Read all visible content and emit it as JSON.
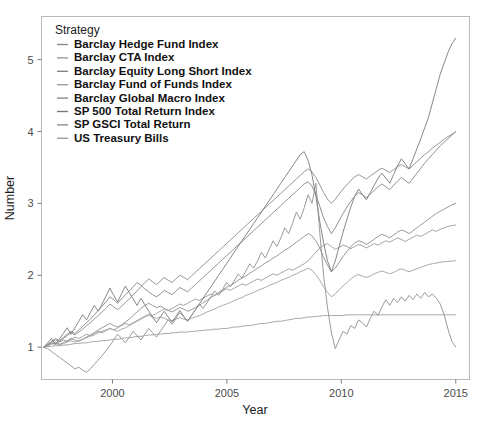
{
  "chart_data": {
    "type": "line",
    "title": "",
    "xlabel": "Year",
    "ylabel": "Number",
    "legend_title": "Strategy",
    "legend_position": "top-left-inside",
    "grid": false,
    "xlim": [
      1996.9,
      2015.6
    ],
    "ylim": [
      0.55,
      5.6
    ],
    "xticks": [
      2000,
      2005,
      2010,
      2015
    ],
    "xtick_labels": [
      "2000",
      "2005",
      "2010",
      "2015"
    ],
    "yticks": [
      1,
      2,
      3,
      4,
      5
    ],
    "ytick_labels": [
      "1",
      "2",
      "3",
      "4",
      "5"
    ],
    "x_start": 1997.0,
    "x_end": 2015.0,
    "note": "Cumulative growth of 1 unit invested; all series indexed to 1.0 at start (1997).",
    "series": [
      {
        "name": "Barclay Hedge Fund Index",
        "color": "#8d8d8d",
        "end_value": 3.0,
        "values": [
          1.0,
          1.02,
          1.05,
          1.07,
          1.04,
          1.06,
          1.09,
          1.12,
          1.1,
          1.08,
          1.11,
          1.14,
          1.17,
          1.2,
          1.24,
          1.27,
          1.3,
          1.33,
          1.3,
          1.28,
          1.31,
          1.35,
          1.39,
          1.44,
          1.49,
          1.54,
          1.58,
          1.61,
          1.58,
          1.55,
          1.57,
          1.54,
          1.51,
          1.49,
          1.52,
          1.55,
          1.53,
          1.5,
          1.52,
          1.55,
          1.58,
          1.62,
          1.65,
          1.69,
          1.72,
          1.76,
          1.8,
          1.83,
          1.86,
          1.89,
          1.93,
          1.96,
          1.99,
          2.03,
          2.06,
          2.1,
          2.13,
          2.17,
          2.2,
          2.24,
          2.27,
          2.31,
          2.35,
          2.38,
          2.42,
          2.46,
          2.5,
          2.54,
          2.58,
          2.55,
          2.48,
          2.38,
          2.25,
          2.14,
          2.05,
          2.1,
          2.18,
          2.26,
          2.33,
          2.4,
          2.45,
          2.48,
          2.46,
          2.43,
          2.46,
          2.5,
          2.54,
          2.57,
          2.55,
          2.52,
          2.56,
          2.6,
          2.63,
          2.61,
          2.58,
          2.62,
          2.66,
          2.7,
          2.74,
          2.78,
          2.82,
          2.86,
          2.89,
          2.92,
          2.95,
          2.98,
          3.0
        ]
      },
      {
        "name": "Barclay CTA Index",
        "color": "#9a9a9a",
        "end_value": 2.7,
        "values": [
          1.0,
          1.03,
          1.06,
          1.04,
          1.07,
          1.1,
          1.08,
          1.11,
          1.14,
          1.12,
          1.15,
          1.18,
          1.16,
          1.19,
          1.22,
          1.2,
          1.23,
          1.26,
          1.24,
          1.27,
          1.3,
          1.33,
          1.31,
          1.34,
          1.37,
          1.4,
          1.43,
          1.46,
          1.44,
          1.47,
          1.5,
          1.53,
          1.51,
          1.54,
          1.57,
          1.6,
          1.58,
          1.61,
          1.64,
          1.67,
          1.65,
          1.68,
          1.71,
          1.74,
          1.72,
          1.75,
          1.78,
          1.81,
          1.79,
          1.82,
          1.85,
          1.88,
          1.86,
          1.89,
          1.92,
          1.95,
          1.93,
          1.96,
          1.99,
          2.02,
          2.0,
          2.03,
          2.06,
          2.09,
          2.07,
          2.1,
          2.13,
          2.16,
          2.2,
          2.26,
          2.32,
          2.38,
          2.42,
          2.44,
          2.4,
          2.36,
          2.39,
          2.42,
          2.4,
          2.37,
          2.4,
          2.43,
          2.41,
          2.38,
          2.41,
          2.44,
          2.42,
          2.45,
          2.48,
          2.46,
          2.49,
          2.52,
          2.5,
          2.47,
          2.5,
          2.53,
          2.56,
          2.54,
          2.57,
          2.6,
          2.63,
          2.61,
          2.64,
          2.66,
          2.68,
          2.69,
          2.7
        ]
      },
      {
        "name": "Barclay Equity Long Short Index",
        "color": "#848484",
        "end_value": 4.0,
        "values": [
          1.0,
          1.04,
          1.08,
          1.12,
          1.09,
          1.13,
          1.18,
          1.22,
          1.19,
          1.24,
          1.29,
          1.34,
          1.39,
          1.45,
          1.51,
          1.57,
          1.63,
          1.7,
          1.66,
          1.61,
          1.67,
          1.73,
          1.78,
          1.84,
          1.9,
          1.86,
          1.81,
          1.77,
          1.73,
          1.7,
          1.74,
          1.79,
          1.76,
          1.73,
          1.78,
          1.83,
          1.8,
          1.77,
          1.82,
          1.87,
          1.92,
          1.97,
          2.02,
          2.07,
          2.12,
          2.17,
          2.22,
          2.27,
          2.32,
          2.37,
          2.42,
          2.47,
          2.52,
          2.57,
          2.62,
          2.67,
          2.72,
          2.77,
          2.82,
          2.87,
          2.92,
          2.97,
          3.02,
          3.07,
          3.12,
          3.17,
          3.22,
          3.27,
          3.3,
          3.24,
          3.12,
          2.96,
          2.8,
          2.68,
          2.58,
          2.66,
          2.76,
          2.86,
          2.95,
          3.03,
          3.1,
          3.15,
          3.12,
          3.08,
          3.13,
          3.18,
          3.23,
          3.27,
          3.23,
          3.19,
          3.25,
          3.31,
          3.36,
          3.32,
          3.28,
          3.35,
          3.42,
          3.49,
          3.56,
          3.62,
          3.68,
          3.74,
          3.8,
          3.85,
          3.9,
          3.95,
          4.0
        ]
      },
      {
        "name": "Barclay Fund of Funds Index",
        "color": "#a0a0a0",
        "end_value": 2.2,
        "values": [
          1.0,
          1.02,
          1.04,
          1.05,
          1.03,
          1.05,
          1.07,
          1.09,
          1.07,
          1.09,
          1.11,
          1.13,
          1.15,
          1.17,
          1.2,
          1.22,
          1.24,
          1.26,
          1.24,
          1.22,
          1.25,
          1.27,
          1.3,
          1.33,
          1.36,
          1.39,
          1.42,
          1.44,
          1.42,
          1.4,
          1.42,
          1.4,
          1.38,
          1.37,
          1.39,
          1.41,
          1.39,
          1.38,
          1.4,
          1.42,
          1.44,
          1.46,
          1.49,
          1.51,
          1.53,
          1.56,
          1.58,
          1.6,
          1.62,
          1.65,
          1.67,
          1.69,
          1.72,
          1.74,
          1.76,
          1.79,
          1.81,
          1.83,
          1.86,
          1.88,
          1.9,
          1.93,
          1.95,
          1.97,
          2.0,
          2.02,
          2.05,
          2.07,
          2.1,
          2.07,
          2.01,
          1.93,
          1.84,
          1.76,
          1.7,
          1.74,
          1.8,
          1.85,
          1.9,
          1.95,
          1.99,
          2.01,
          1.99,
          1.97,
          1.99,
          2.02,
          2.04,
          2.06,
          2.04,
          2.02,
          2.04,
          2.07,
          2.09,
          2.07,
          2.05,
          2.07,
          2.09,
          2.11,
          2.13,
          2.15,
          2.16,
          2.17,
          2.18,
          2.19,
          2.19,
          2.2,
          2.2
        ]
      },
      {
        "name": "Barclay Global Macro Index",
        "color": "#8a8a8a",
        "end_value": 4.0,
        "values": [
          1.0,
          1.03,
          1.07,
          1.1,
          1.08,
          1.12,
          1.16,
          1.2,
          1.17,
          1.21,
          1.25,
          1.3,
          1.34,
          1.39,
          1.44,
          1.49,
          1.54,
          1.6,
          1.56,
          1.52,
          1.57,
          1.62,
          1.67,
          1.73,
          1.78,
          1.84,
          1.9,
          1.95,
          1.91,
          1.87,
          1.92,
          1.97,
          1.93,
          1.9,
          1.95,
          2.0,
          1.97,
          1.94,
          1.99,
          2.04,
          2.09,
          2.14,
          2.19,
          2.24,
          2.29,
          2.34,
          2.39,
          2.44,
          2.49,
          2.54,
          2.59,
          2.64,
          2.69,
          2.74,
          2.79,
          2.84,
          2.89,
          2.94,
          2.99,
          3.04,
          3.09,
          3.14,
          3.19,
          3.24,
          3.29,
          3.34,
          3.39,
          3.44,
          3.48,
          3.44,
          3.36,
          3.26,
          3.15,
          3.06,
          3.0,
          3.06,
          3.13,
          3.2,
          3.26,
          3.32,
          3.37,
          3.4,
          3.37,
          3.34,
          3.38,
          3.42,
          3.46,
          3.49,
          3.46,
          3.43,
          3.47,
          3.51,
          3.54,
          3.51,
          3.48,
          3.53,
          3.58,
          3.63,
          3.68,
          3.72,
          3.77,
          3.81,
          3.85,
          3.89,
          3.93,
          3.96,
          4.0
        ]
      },
      {
        "name": "SP 500 Total Return Index",
        "color": "#797979",
        "end_value": 5.3,
        "values": [
          1.0,
          1.06,
          1.12,
          1.04,
          1.11,
          1.19,
          1.27,
          1.18,
          1.27,
          1.36,
          1.45,
          1.38,
          1.48,
          1.58,
          1.5,
          1.6,
          1.71,
          1.82,
          1.72,
          1.63,
          1.74,
          1.85,
          1.76,
          1.67,
          1.58,
          1.68,
          1.59,
          1.5,
          1.42,
          1.34,
          1.42,
          1.5,
          1.42,
          1.35,
          1.43,
          1.51,
          1.43,
          1.36,
          1.44,
          1.52,
          1.6,
          1.68,
          1.76,
          1.84,
          1.92,
          2.0,
          2.08,
          2.16,
          2.24,
          2.32,
          2.4,
          2.48,
          2.56,
          2.64,
          2.72,
          2.8,
          2.88,
          2.96,
          3.04,
          3.12,
          3.2,
          3.28,
          3.36,
          3.44,
          3.52,
          3.6,
          3.68,
          3.72,
          3.6,
          3.4,
          3.1,
          2.75,
          2.45,
          2.2,
          2.05,
          2.2,
          2.4,
          2.6,
          2.78,
          2.95,
          3.1,
          3.2,
          3.12,
          3.05,
          3.15,
          3.25,
          3.35,
          3.42,
          3.35,
          3.28,
          3.4,
          3.52,
          3.62,
          3.55,
          3.48,
          3.62,
          3.76,
          3.9,
          4.05,
          4.2,
          4.4,
          4.6,
          4.8,
          4.95,
          5.1,
          5.22,
          5.3
        ]
      },
      {
        "name": "SP GSCI Total Return",
        "color": "#8f8f8f",
        "end_value": 1.0,
        "values": [
          1.0,
          0.98,
          0.94,
          0.9,
          0.86,
          0.82,
          0.78,
          0.74,
          0.7,
          0.72,
          0.68,
          0.65,
          0.7,
          0.76,
          0.82,
          0.88,
          0.95,
          1.02,
          1.1,
          1.18,
          1.12,
          1.06,
          1.14,
          1.22,
          1.16,
          1.1,
          1.18,
          1.26,
          1.2,
          1.14,
          1.22,
          1.3,
          1.38,
          1.32,
          1.4,
          1.48,
          1.42,
          1.36,
          1.44,
          1.52,
          1.6,
          1.54,
          1.62,
          1.7,
          1.78,
          1.72,
          1.8,
          1.9,
          1.84,
          1.92,
          2.02,
          1.96,
          2.06,
          2.16,
          2.1,
          2.2,
          2.32,
          2.24,
          2.36,
          2.48,
          2.4,
          2.52,
          2.66,
          2.58,
          2.72,
          2.88,
          2.78,
          2.94,
          3.12,
          3.0,
          3.28,
          2.6,
          2.0,
          1.55,
          1.2,
          0.98,
          1.1,
          1.22,
          1.18,
          1.3,
          1.26,
          1.38,
          1.34,
          1.28,
          1.4,
          1.5,
          1.44,
          1.56,
          1.66,
          1.58,
          1.68,
          1.62,
          1.7,
          1.64,
          1.72,
          1.66,
          1.74,
          1.68,
          1.76,
          1.7,
          1.74,
          1.68,
          1.6,
          1.45,
          1.25,
          1.08,
          1.0
        ]
      },
      {
        "name": "US Treasury Bills",
        "color": "#9e9e9e",
        "end_value": 1.45,
        "values": [
          1.0,
          1.01,
          1.01,
          1.02,
          1.02,
          1.03,
          1.03,
          1.04,
          1.05,
          1.05,
          1.06,
          1.06,
          1.07,
          1.08,
          1.08,
          1.09,
          1.09,
          1.1,
          1.11,
          1.11,
          1.12,
          1.13,
          1.13,
          1.14,
          1.15,
          1.15,
          1.16,
          1.17,
          1.17,
          1.18,
          1.18,
          1.19,
          1.19,
          1.2,
          1.2,
          1.21,
          1.21,
          1.21,
          1.22,
          1.22,
          1.23,
          1.23,
          1.24,
          1.24,
          1.25,
          1.25,
          1.26,
          1.26,
          1.27,
          1.28,
          1.28,
          1.29,
          1.3,
          1.3,
          1.31,
          1.32,
          1.33,
          1.33,
          1.34,
          1.35,
          1.36,
          1.36,
          1.37,
          1.38,
          1.39,
          1.4,
          1.4,
          1.41,
          1.42,
          1.42,
          1.43,
          1.43,
          1.44,
          1.44,
          1.44,
          1.44,
          1.44,
          1.44,
          1.45,
          1.45,
          1.45,
          1.45,
          1.45,
          1.45,
          1.45,
          1.45,
          1.45,
          1.45,
          1.45,
          1.45,
          1.45,
          1.45,
          1.45,
          1.45,
          1.45,
          1.45,
          1.45,
          1.45,
          1.45,
          1.45,
          1.45,
          1.45,
          1.45,
          1.45,
          1.45,
          1.45,
          1.45
        ]
      }
    ]
  },
  "legend": {
    "title": "Strategy",
    "items": [
      "Barclay Hedge Fund Index",
      "Barclay CTA Index",
      "Barclay Equity Long Short Index",
      "Barclay Fund of Funds Index",
      "Barclay Global Macro Index",
      "SP 500 Total Return Index",
      "SP GSCI Total Return",
      "US Treasury Bills"
    ]
  },
  "axes": {
    "x_title": "Year",
    "y_title": "Number",
    "x_tick_labels": [
      "2000",
      "2005",
      "2010",
      "2015"
    ],
    "y_tick_labels": [
      "1",
      "2",
      "3",
      "4",
      "5"
    ]
  },
  "style": {
    "panel_border_color": "#b9b9b9",
    "tick_color": "#7a7a7a",
    "text_color": "#1a1a1a",
    "background": "#ffffff"
  }
}
